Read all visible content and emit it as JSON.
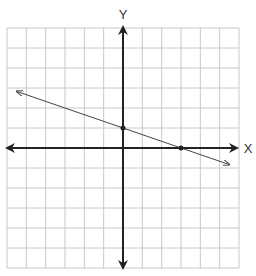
{
  "chart_data": {
    "type": "line",
    "title": "",
    "xlabel": "X",
    "ylabel": "Y",
    "xlim": [
      -6,
      6
    ],
    "ylim": [
      -6,
      6
    ],
    "grid": true,
    "grid_step": 1,
    "tick_labels_shown": false,
    "series": [
      {
        "name": "line",
        "equation": "y = -1/3 x + 1",
        "slope": -0.3333,
        "y_intercept": 1,
        "x_intercept": 3,
        "x": [
          -5.5,
          5.5
        ],
        "y": [
          2.83,
          -0.83
        ],
        "arrows_both_ends": true
      }
    ],
    "points": [
      {
        "x": 0,
        "y": 1,
        "label": "y-intercept"
      },
      {
        "x": 3,
        "y": 0,
        "label": "x-intercept"
      }
    ]
  },
  "labels": {
    "x_axis": "X",
    "y_axis": "Y"
  },
  "colors": {
    "grid": "#c8c8c8",
    "axis": "#222222",
    "line": "#444444",
    "point": "#222222"
  }
}
